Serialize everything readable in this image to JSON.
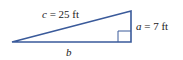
{
  "diagram": {
    "type": "right-triangle",
    "stroke_color": "#3a5a9a",
    "labels": {
      "hypotenuse": {
        "var": "c",
        "eq": " = 25 ft"
      },
      "leg_a": {
        "var": "a",
        "eq": " = 7 ft"
      },
      "leg_b": {
        "var": "b"
      }
    }
  }
}
